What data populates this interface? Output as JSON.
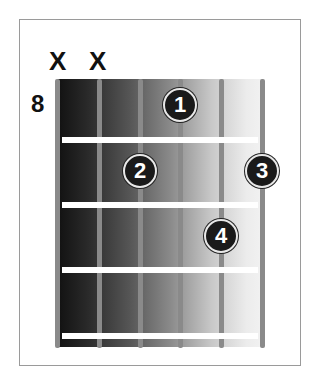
{
  "diagram": {
    "type": "guitar-chord-chart",
    "start_fret_label": "8",
    "muted_strings": [
      {
        "string": 1,
        "label": "X"
      },
      {
        "string": 2,
        "label": "X"
      }
    ],
    "fingers": [
      {
        "finger": "1",
        "string": 4,
        "fret": 1
      },
      {
        "finger": "2",
        "string": 3,
        "fret": 2
      },
      {
        "finger": "3",
        "string": 6,
        "fret": 2
      },
      {
        "finger": "4",
        "string": 5,
        "fret": 3
      }
    ],
    "num_strings": 6,
    "num_frets": 4
  }
}
